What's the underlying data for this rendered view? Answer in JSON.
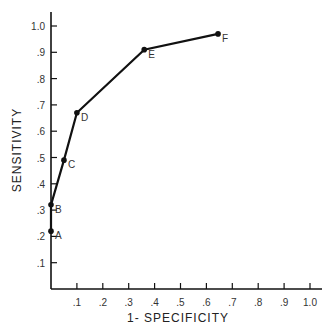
{
  "chart_data": {
    "type": "line",
    "title": "",
    "xlabel": "1- SPECIFICITY",
    "ylabel": "SENSITIVITY",
    "xlim": [
      0,
      1.0
    ],
    "ylim": [
      0,
      1.0
    ],
    "grid": false,
    "legend": null,
    "x_ticks": [
      ".1",
      ".2",
      ".3",
      ".4",
      ".5",
      ".6",
      ".7",
      ".8",
      ".9",
      "1.0"
    ],
    "y_ticks": [
      ".1",
      ".2",
      ".3",
      ".4",
      ".5",
      ".6",
      ".7",
      ".8",
      ".9",
      "1.0"
    ],
    "series": [
      {
        "name": "ROC curve",
        "points": [
          {
            "label": "A",
            "x": 0.0,
            "y": 0.22
          },
          {
            "label": "B",
            "x": 0.0,
            "y": 0.32
          },
          {
            "label": "C",
            "x": 0.05,
            "y": 0.49
          },
          {
            "label": "D",
            "x": 0.1,
            "y": 0.67
          },
          {
            "label": "E",
            "x": 0.36,
            "y": 0.91
          },
          {
            "label": "F",
            "x": 0.645,
            "y": 0.97
          }
        ]
      }
    ]
  }
}
